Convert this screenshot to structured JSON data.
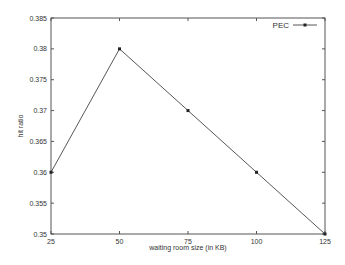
{
  "chart_data": {
    "type": "line",
    "title": "",
    "xlabel": "waiting room size (in KB)",
    "ylabel": "hit ratio",
    "x": [
      25,
      50,
      75,
      100,
      125
    ],
    "series": [
      {
        "name": "PEC",
        "values": [
          0.36,
          0.38,
          0.37,
          0.36,
          0.35
        ],
        "color": "#444444",
        "marker": "square"
      }
    ],
    "xlim": [
      25,
      125
    ],
    "ylim": [
      0.35,
      0.385
    ],
    "xticks": [
      "25",
      "50",
      "75",
      "100",
      "125"
    ],
    "yticks": [
      "0.35",
      "0.355",
      "0.36",
      "0.365",
      "0.37",
      "0.375",
      "0.38",
      "0.385"
    ],
    "grid": false,
    "legend_position": "upper right"
  }
}
